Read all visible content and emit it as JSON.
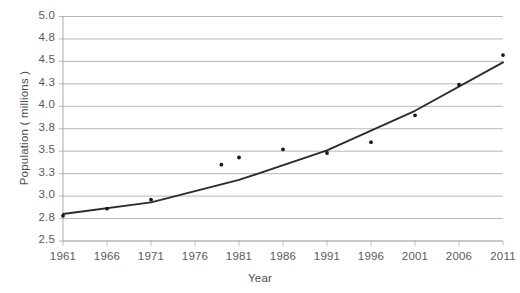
{
  "chart_data": {
    "type": "scatter",
    "title": "",
    "xlabel": "Year",
    "ylabel": "Population ( millions )",
    "xlim": [
      1961,
      2011
    ],
    "ylim": [
      2.5,
      5.0
    ],
    "grid": "horizontal",
    "legend": "none",
    "xticks": [
      "1961",
      "1966",
      "1971",
      "1976",
      "1981",
      "1986",
      "1991",
      "1996",
      "2001",
      "2006",
      "2011"
    ],
    "yticks": [
      "5.0",
      "4.8",
      "4.5",
      "4.3",
      "4.0",
      "3.8",
      "3.5",
      "3.3",
      "3.0",
      "2.8",
      "2.5"
    ],
    "ytick_values": [
      5.0,
      4.75,
      4.5,
      4.25,
      4.0,
      3.75,
      3.5,
      3.25,
      3.0,
      2.75,
      2.5
    ],
    "series": [
      {
        "name": "Population",
        "marker": "dot",
        "color": "#1a1a1a",
        "x": [
          1961,
          1966,
          1971,
          1979,
          1981,
          1986,
          1991,
          1996,
          2001,
          2006,
          2011
        ],
        "y": [
          2.78,
          2.86,
          2.96,
          3.35,
          3.43,
          3.52,
          3.48,
          3.6,
          3.9,
          4.24,
          4.57
        ]
      },
      {
        "name": "Trend line",
        "marker": "line",
        "color": "#2b2b2b",
        "x": [
          1961,
          1971,
          1981,
          1991,
          2001,
          2011
        ],
        "y": [
          2.8,
          2.93,
          3.18,
          3.51,
          3.95,
          4.49
        ]
      }
    ]
  },
  "axes": {
    "y_title": "Population ( millions )",
    "x_title": "Year"
  }
}
